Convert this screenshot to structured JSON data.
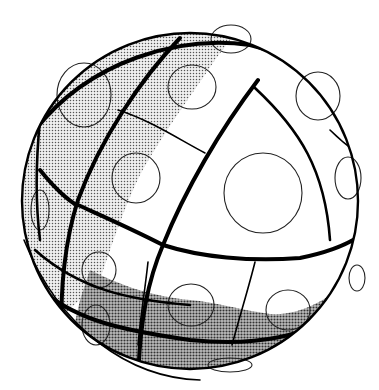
{
  "figure": {
    "colors": {
      "background": "#ffffff",
      "outline": "#000000",
      "light_shade": "#d9d9d9",
      "dark_shade": "#9a9a9a"
    },
    "sphere": {
      "cx": 190,
      "cy": 200,
      "r": 168
    },
    "circles": [
      {
        "cx": 263,
        "cy": 193,
        "rx": 39,
        "ry": 40
      },
      {
        "cx": 84,
        "cy": 95,
        "rx": 27,
        "ry": 32
      },
      {
        "cx": 192,
        "cy": 87,
        "rx": 24,
        "ry": 22
      },
      {
        "cx": 136,
        "cy": 178,
        "rx": 24,
        "ry": 25
      },
      {
        "cx": 318,
        "cy": 96,
        "rx": 22,
        "ry": 24
      },
      {
        "cx": 348,
        "cy": 178,
        "rx": 13,
        "ry": 21
      },
      {
        "cx": 40,
        "cy": 210,
        "rx": 9,
        "ry": 20
      },
      {
        "cx": 99,
        "cy": 270,
        "rx": 17,
        "ry": 18
      },
      {
        "cx": 191,
        "cy": 305,
        "rx": 23,
        "ry": 21
      },
      {
        "cx": 288,
        "cy": 310,
        "rx": 22,
        "ry": 20
      },
      {
        "cx": 357,
        "cy": 278,
        "rx": 8,
        "ry": 13
      },
      {
        "cx": 96,
        "cy": 325,
        "rx": 14,
        "ry": 20
      },
      {
        "cx": 230,
        "cy": 365,
        "rx": 22,
        "ry": 7
      },
      {
        "cx": 231,
        "cy": 39,
        "rx": 20,
        "ry": 14
      }
    ]
  }
}
